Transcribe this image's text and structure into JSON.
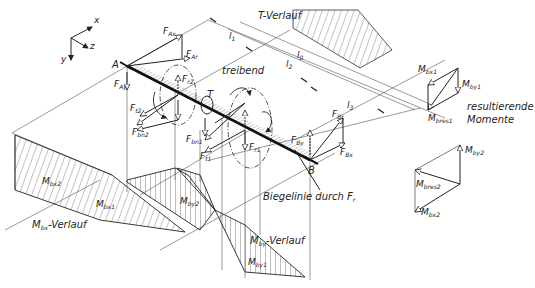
{
  "axes": {
    "x": "x",
    "y": "y",
    "z": "z"
  },
  "points": {
    "a": "A",
    "b": "B"
  },
  "forces": {
    "f_ax": {
      "main": "F",
      "sub": "Ax"
    },
    "f_ar": {
      "main": "F",
      "sub": "Ar"
    },
    "f_ay": {
      "main": "F",
      "sub": "Ay"
    },
    "f_r2": {
      "main": "F",
      "sub": "r2"
    },
    "f_t2": {
      "main": "F",
      "sub": "t2"
    },
    "f_bn2": {
      "main": "F",
      "sub": "bn2"
    },
    "f_bn1": {
      "main": "F",
      "sub": "bn1"
    },
    "f_t1": {
      "main": "F",
      "sub": "t1"
    },
    "f_r1": {
      "main": "F",
      "sub": "r1"
    },
    "f_by": {
      "main": "F",
      "sub": "By"
    },
    "f_br": {
      "main": "F",
      "sub": "Br"
    },
    "f_bx": {
      "main": "F",
      "sub": "Bx"
    }
  },
  "torque": "T",
  "dimensions": {
    "l1": "l",
    "l1_sub": "1",
    "l2": "l",
    "l2_sub": "2",
    "l0": "l",
    "l0_sub": "0",
    "l3": "l",
    "l3_sub": "3"
  },
  "annotations": {
    "t_verlauf": "T-Verlauf",
    "treibend": "treibend",
    "biegelinie": "Biegelinie durch F",
    "biegelinie_sub": "r",
    "mbx_verlauf_main": "M",
    "mbx_verlauf_sub": "bx",
    "mbx_verlauf_rest": "-Verlauf",
    "mby_verlauf_main": "M",
    "mby_verlauf_sub": "by",
    "mby_verlauf_rest": "-Verlauf",
    "resultierende": "resultierende",
    "momente": "Momente"
  },
  "moments": {
    "m_bx1": {
      "main": "M",
      "sub": "bx1"
    },
    "m_bx2": {
      "main": "M",
      "sub": "bx2"
    },
    "m_by1": {
      "main": "M",
      "sub": "by1"
    },
    "m_by2": {
      "main": "M",
      "sub": "by2"
    },
    "m_bres1": {
      "main": "M",
      "sub": "bres1"
    },
    "m_bres2": {
      "main": "M",
      "sub": "bres2"
    }
  },
  "right_panel": {
    "m_bx1": {
      "main": "M",
      "sub": "bx1"
    },
    "m_by1": {
      "main": "M",
      "sub": "by1"
    },
    "m_bres1": {
      "main": "M",
      "sub": "bres1"
    },
    "m_by2": {
      "main": "M",
      "sub": "by2"
    },
    "m_bres2": {
      "main": "M",
      "sub": "bres2"
    },
    "m_bx2": {
      "main": "M",
      "sub": "bx2"
    }
  }
}
